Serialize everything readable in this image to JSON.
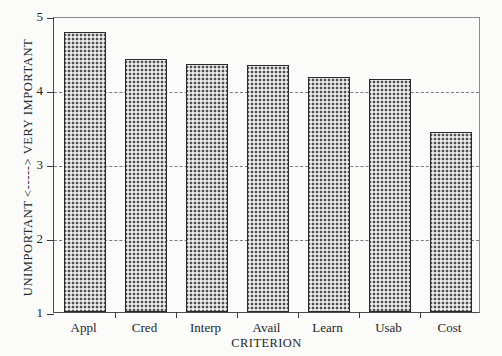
{
  "chart_data": {
    "type": "bar",
    "title": "",
    "subtitle": "",
    "categories": [
      "Appl",
      "Cred",
      "Interp",
      "Avail",
      "Learn",
      "Usab",
      "Cost"
    ],
    "values": [
      4.78,
      4.42,
      4.35,
      4.34,
      4.17,
      4.15,
      3.43
    ],
    "xlabel": "CRITERION",
    "ylabel": "UNIMPORTANT <-----> VERY IMPORTANT",
    "ylim": [
      1,
      5
    ],
    "yticks": [
      1,
      2,
      3,
      4,
      5
    ],
    "ytick_labels": [
      "1",
      "2",
      "3",
      "4",
      "5"
    ],
    "gridlines": [
      2,
      3,
      4
    ],
    "grid": true,
    "grid_style": "dashed",
    "legend": "none",
    "bar_fill": "#4e4e4e",
    "bar_pattern": "checkered-dither",
    "background_color": "#fbfbf9",
    "axis_color": "#3a3a3a"
  },
  "axes": {
    "y_title": "UNIMPORTANT <-----> VERY IMPORTANT",
    "x_title": "CRITERION"
  }
}
